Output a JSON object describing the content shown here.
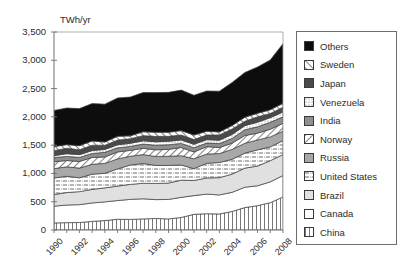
{
  "top_strip": {
    "ghost_text": " "
  },
  "chart_data": {
    "type": "area",
    "stacked": true,
    "title": "",
    "subtitle": "",
    "xlabel": "",
    "ylabel": "TWh/yr",
    "y_unit_label": "TWh/yr",
    "grid": false,
    "legend_position": "right",
    "ylim": [
      0,
      3500
    ],
    "xlim": [
      1990,
      2008
    ],
    "ytick_labels": [
      "3,500",
      "3,000",
      "2,500",
      "2,000",
      "1,500",
      "1,000",
      "500",
      "0"
    ],
    "ytick_values": [
      3500,
      3000,
      2500,
      2000,
      1500,
      1000,
      500,
      0
    ],
    "xtick_labels": [
      "1990",
      "1992",
      "1994",
      "1996",
      "1998",
      "2000",
      "2002",
      "2004",
      "2006",
      "2008"
    ],
    "xtick_values": [
      1990,
      1992,
      1994,
      1996,
      1998,
      2000,
      2002,
      2004,
      2006,
      2008
    ],
    "x": [
      1990,
      1991,
      1992,
      1993,
      1994,
      1995,
      1996,
      1997,
      1998,
      1999,
      2000,
      2001,
      2002,
      2003,
      2004,
      2005,
      2006,
      2007,
      2008
    ],
    "series": [
      {
        "name": "China",
        "fill": "#ffffff",
        "pattern": "vertical-lines",
        "values": [
          125,
          130,
          132,
          152,
          167,
          190,
          187,
          196,
          204,
          196,
          222,
          277,
          288,
          283,
          328,
          396,
          430,
          482,
          585
        ]
      },
      {
        "name": "Canada",
        "fill": "#ffffff",
        "pattern": "solid",
        "values": [
          296,
          312,
          316,
          326,
          330,
          331,
          354,
          356,
          333,
          344,
          355,
          331,
          346,
          337,
          338,
          360,
          352,
          369,
          378
        ]
      },
      {
        "name": "Brazil",
        "fill": "#e0e0e0",
        "pattern": "solid",
        "values": [
          205,
          220,
          230,
          240,
          248,
          255,
          265,
          275,
          285,
          290,
          304,
          267,
          286,
          305,
          321,
          338,
          348,
          374,
          370
        ]
      },
      {
        "name": "United States",
        "fill": "#ffffff",
        "pattern": "dash-dot",
        "values": [
          293,
          288,
          244,
          269,
          257,
          304,
          343,
          348,
          319,
          312,
          268,
          210,
          259,
          268,
          262,
          265,
          286,
          243,
          246
        ]
      },
      {
        "name": "Russia",
        "fill": "#a8a8a8",
        "pattern": "solid",
        "values": [
          166,
          167,
          172,
          175,
          176,
          177,
          155,
          158,
          159,
          161,
          165,
          173,
          164,
          158,
          176,
          174,
          175,
          178,
          167
        ]
      },
      {
        "name": "Norway",
        "fill": "#ffffff",
        "pattern": "diagonal-right",
        "values": [
          121,
          111,
          118,
          120,
          113,
          123,
          104,
          111,
          117,
          122,
          143,
          122,
          130,
          107,
          110,
          137,
          121,
          135,
          140
        ]
      },
      {
        "name": "India",
        "fill": "#8f8f8f",
        "pattern": "solid",
        "values": [
          72,
          73,
          70,
          71,
          82,
          73,
          69,
          75,
          82,
          82,
          74,
          74,
          64,
          69,
          84,
          101,
          113,
          123,
          114
        ]
      },
      {
        "name": "Venezuela",
        "fill": "#ffffff",
        "pattern": "fine-dots",
        "values": [
          36,
          49,
          50,
          51,
          52,
          53,
          55,
          58,
          60,
          62,
          61,
          61,
          59,
          60,
          70,
          74,
          81,
          82,
          87
        ]
      },
      {
        "name": "Japan",
        "fill": "#4a4a4a",
        "pattern": "solid",
        "values": [
          88,
          96,
          85,
          95,
          72,
          83,
          81,
          91,
          96,
          87,
          87,
          84,
          83,
          94,
          98,
          77,
          95,
          74,
          83
        ]
      },
      {
        "name": "Sweden",
        "fill": "#ffffff",
        "pattern": "diagonal-left",
        "values": [
          72,
          63,
          74,
          75,
          58,
          68,
          51,
          68,
          74,
          71,
          78,
          79,
          66,
          53,
          60,
          72,
          61,
          66,
          69
        ]
      },
      {
        "name": "Others",
        "fill": "#0d0d0d",
        "pattern": "solid",
        "values": [
          640,
          648,
          655,
          662,
          670,
          678,
          686,
          694,
          700,
          706,
          716,
          704,
          712,
          720,
          760,
          790,
          820,
          880,
          1055
        ]
      }
    ],
    "totals": [
      2114,
      2157,
      2146,
      2236,
      2225,
      2335,
      2350,
      2430,
      2429,
      2433,
      2473,
      2382,
      2457,
      2454,
      2607,
      2784,
      2882,
      3006,
      3294
    ],
    "legend_entries": [
      {
        "label": "Others",
        "fill": "#0d0d0d",
        "pattern": "solid"
      },
      {
        "label": "Sweden",
        "fill": "#ffffff",
        "pattern": "diagonal-left"
      },
      {
        "label": "Japan",
        "fill": "#4a4a4a",
        "pattern": "solid"
      },
      {
        "label": "Venezuela",
        "fill": "#ffffff",
        "pattern": "fine-dots"
      },
      {
        "label": "India",
        "fill": "#8f8f8f",
        "pattern": "solid"
      },
      {
        "label": "Norway",
        "fill": "#ffffff",
        "pattern": "diagonal-right"
      },
      {
        "label": "Russia",
        "fill": "#a8a8a8",
        "pattern": "solid"
      },
      {
        "label": "United States",
        "fill": "#ffffff",
        "pattern": "dash-dot"
      },
      {
        "label": "Brazil",
        "fill": "#e0e0e0",
        "pattern": "solid"
      },
      {
        "label": "Canada",
        "fill": "#ffffff",
        "pattern": "solid"
      },
      {
        "label": "China",
        "fill": "#ffffff",
        "pattern": "vertical-lines"
      }
    ]
  }
}
